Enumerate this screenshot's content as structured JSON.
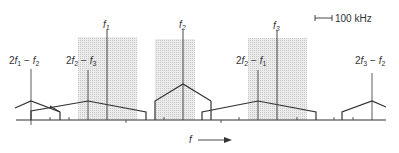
{
  "diagram": {
    "title": "",
    "scale_bar": {
      "label": "100 kHz"
    },
    "axis": {
      "label": "f"
    },
    "carriers": [
      {
        "id": "f1",
        "base": "f",
        "sub": "1",
        "x": 107
      },
      {
        "id": "f2",
        "base": "f",
        "sub": "2",
        "x": 183
      },
      {
        "id": "f3",
        "base": "f",
        "sub": "3",
        "x": 277
      }
    ],
    "intermod_products": [
      {
        "id": "2f1-f2",
        "coef": "2",
        "a": "f",
        "asub": "1",
        "op": " − ",
        "b": "f",
        "bsub": "2",
        "x": 31
      },
      {
        "id": "2f2-f3",
        "coef": "2",
        "a": "f",
        "asub": "2",
        "op": " − ",
        "b": "f",
        "bsub": "3",
        "x": 88
      },
      {
        "id": "2f2-f1",
        "coef": "2",
        "a": "f",
        "asub": "2",
        "op": " − ",
        "b": "f",
        "bsub": "1",
        "x": 258
      },
      {
        "id": "2f3-f2",
        "coef": "2",
        "a": "f",
        "asub": "3",
        "op": " − ",
        "b": "f",
        "bsub": "2",
        "x": 372
      }
    ],
    "colors": {
      "line": "#333333",
      "shade": "#d9d9d9"
    }
  }
}
